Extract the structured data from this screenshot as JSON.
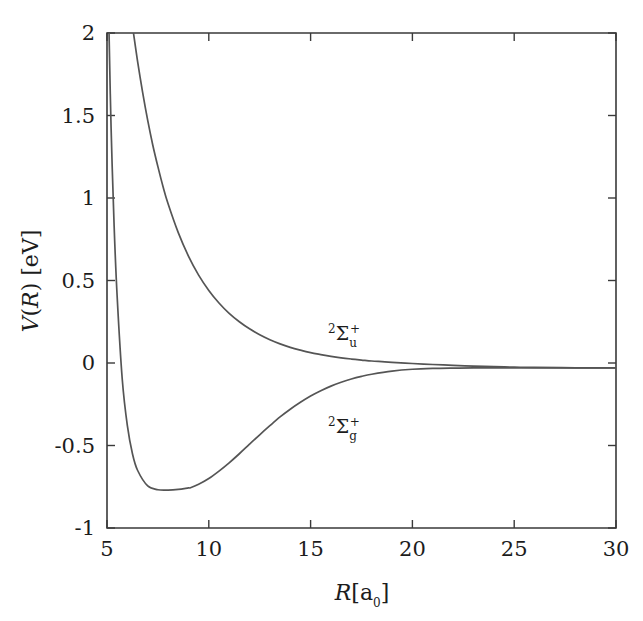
{
  "figure": {
    "background_color": "#ffffff",
    "curve_color": "#555555",
    "axis_color": "#3a3a3a",
    "width": 643,
    "height": 621
  },
  "axes": {
    "x_label_main": "R",
    "x_label_unit_open": "[a",
    "x_label_unit_sub": "0",
    "x_label_unit_close": "]",
    "y_label_v": "V",
    "y_label_paren_open": "(",
    "y_label_r": "R",
    "y_label_paren_close": ")",
    "y_label_unit": " [eV]",
    "x_ticks": [
      "5",
      "10",
      "15",
      "20",
      "25",
      "30"
    ],
    "y_ticks": [
      "2",
      "1.5",
      "1",
      "0.5",
      "0",
      "-0.5",
      "-1"
    ]
  },
  "annotations": {
    "upper_curve": {
      "sup_left": "2",
      "symbol": "Σ",
      "sub_right": "u",
      "sup_right": "+"
    },
    "lower_curve": {
      "sup_left": "2",
      "symbol": "Σ",
      "sub_right": "g",
      "sup_right": "+"
    }
  },
  "chart_data": {
    "type": "line",
    "title": "",
    "xlabel": "R[a_0]",
    "ylabel": "V(R) [eV]",
    "xlim": [
      5,
      30
    ],
    "ylim": [
      -1,
      2
    ],
    "xticks": [
      5,
      10,
      15,
      20,
      25,
      30
    ],
    "yticks": [
      -1,
      -0.5,
      0,
      0.5,
      1,
      1.5,
      2
    ],
    "grid": false,
    "legend": "inline-annotation",
    "asymptote": -0.03,
    "series": [
      {
        "name": "2Sigma_u^+",
        "label": "²Σᵤ⁺",
        "color": "#555555",
        "x": [
          6.3,
          6.5,
          6.75,
          7.0,
          7.25,
          7.5,
          7.75,
          8.0,
          8.5,
          9.0,
          9.5,
          10.0,
          10.5,
          11.0,
          11.5,
          12.0,
          12.5,
          13.0,
          13.5,
          14.0,
          14.5,
          15.0,
          15.5,
          16.0,
          16.5,
          17.0,
          17.5,
          18.0,
          18.5,
          19.0,
          20.0,
          21.0,
          22.0,
          23.0,
          24.0,
          25.0,
          26.0,
          28.0,
          30.0
        ],
        "y": [
          2.0,
          1.83,
          1.64,
          1.47,
          1.32,
          1.19,
          1.07,
          0.965,
          0.79,
          0.648,
          0.533,
          0.44,
          0.364,
          0.301,
          0.25,
          0.207,
          0.171,
          0.141,
          0.116,
          0.095,
          0.078,
          0.063,
          0.051,
          0.04,
          0.031,
          0.024,
          0.018,
          0.012,
          0.008,
          0.004,
          -0.003,
          -0.009,
          -0.014,
          -0.019,
          -0.022,
          -0.025,
          -0.027,
          -0.029,
          -0.03
        ]
      },
      {
        "name": "2Sigma_g^+",
        "label": "²Σ_g⁺",
        "color": "#555555",
        "x": [
          5.1,
          5.2,
          5.35,
          5.5,
          5.75,
          6.0,
          6.25,
          6.5,
          7.0,
          7.5,
          8.0,
          8.5,
          9.0,
          9.1,
          9.5,
          10.0,
          10.5,
          11.0,
          11.5,
          12.0,
          12.5,
          13.0,
          13.5,
          14.0,
          14.5,
          15.0,
          15.5,
          16.0,
          16.5,
          17.0,
          17.5,
          18.0,
          19.0,
          20.0,
          21.0,
          22.0,
          23.0,
          25.0,
          27.0,
          30.0
        ],
        "y": [
          2.0,
          1.43,
          0.83,
          0.4,
          -0.1,
          -0.38,
          -0.55,
          -0.65,
          -0.745,
          -0.768,
          -0.77,
          -0.766,
          -0.757,
          -0.756,
          -0.735,
          -0.7,
          -0.655,
          -0.605,
          -0.55,
          -0.492,
          -0.435,
          -0.38,
          -0.327,
          -0.28,
          -0.238,
          -0.2,
          -0.168,
          -0.14,
          -0.117,
          -0.097,
          -0.081,
          -0.068,
          -0.049,
          -0.038,
          -0.033,
          -0.031,
          -0.03,
          -0.03,
          -0.03,
          -0.03
        ]
      }
    ]
  }
}
